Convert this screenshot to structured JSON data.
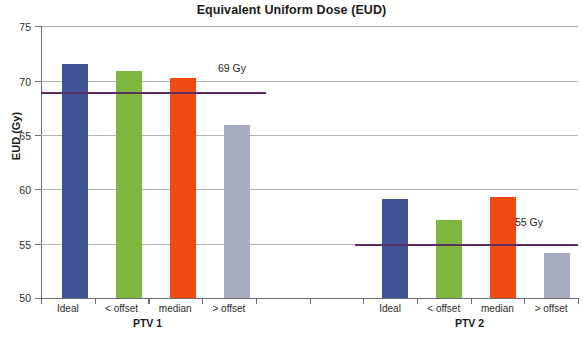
{
  "chart_data": {
    "type": "bar",
    "title": "Equivalent Uniform Dose (EUD)",
    "xlabel": "",
    "ylabel": "EUD (Gy)",
    "ylim": [
      50,
      75
    ],
    "yticks": [
      50,
      55,
      60,
      65,
      70,
      75
    ],
    "ytick_labels": [
      "50",
      "55",
      "60",
      "65",
      "70",
      "75"
    ],
    "grid": true,
    "legend": "none",
    "categories": [
      "Ideal",
      "< offset",
      "median",
      "> offset"
    ],
    "groups": [
      {
        "name": "PTV 1",
        "values": [
          71.6,
          70.9,
          70.3,
          66.0
        ],
        "reference_line": {
          "value": 69,
          "label": "69 Gy",
          "color": "#5c2d5c"
        }
      },
      {
        "name": "PTV 2",
        "values": [
          59.1,
          57.2,
          59.3,
          54.2
        ],
        "reference_line": {
          "value": 55,
          "label": "55 Gy",
          "color": "#5c2d5c"
        }
      }
    ],
    "bar_colors": [
      "#3f5496",
      "#7db73f",
      "#ee4a12",
      "#a8acc0"
    ],
    "bar_color_names": [
      "dark-blue",
      "green",
      "orange-red",
      "light-gray-blue"
    ]
  },
  "axis": {
    "y_title": "EUD (Gy)"
  },
  "labels": {
    "ptv1": {
      "group": "PTV 1",
      "cats": [
        "Ideal",
        "< offset",
        "median",
        "> offset"
      ],
      "ref": "69 Gy"
    },
    "ptv2": {
      "group": "PTV 2",
      "cats": [
        "Ideal",
        "< offset",
        "median",
        "> offset"
      ],
      "ref": "55 Gy"
    }
  },
  "yticks": {
    "t75": "75",
    "t70": "70",
    "t65": "65",
    "t60": "60",
    "t55": "55",
    "t50": "50"
  },
  "title": "Equivalent Uniform Dose (EUD)"
}
